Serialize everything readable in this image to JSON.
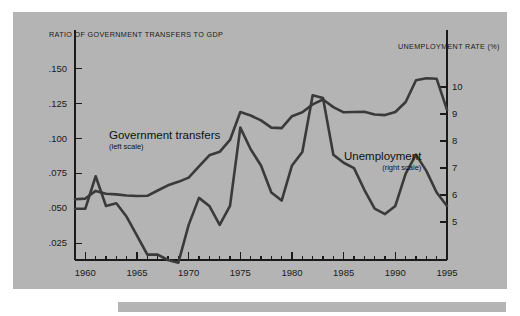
{
  "figure": {
    "panel_color": "#b4b4b4",
    "line_color": "#3a3a3a",
    "axis_color": "#1a1a1a"
  },
  "chart_data": {
    "type": "line",
    "title": "",
    "xlabel": "",
    "ylabel": "RATIO OF GOVERNMENT TRANSFERS TO GDP",
    "y2label": "UNEMPLOYMENT RATE (%)",
    "grid": false,
    "legend_position": "inline-annotation",
    "xlim": [
      1959,
      1995
    ],
    "ylim": [
      0.013,
      0.162
    ],
    "y2lim": [
      3.6,
      11.3
    ],
    "xticks": [
      1960,
      1965,
      1970,
      1975,
      1980,
      1985,
      1990,
      1995
    ],
    "xticklabels": [
      "1960",
      "1965",
      "1970",
      "1975",
      "1980",
      "1985",
      "1990",
      "1995"
    ],
    "xminorticks_every": 1,
    "yticks": [
      0.025,
      0.05,
      0.075,
      0.1,
      0.125,
      0.15
    ],
    "yticklabels": [
      ".025",
      ".050",
      ".075",
      ".100",
      ".125",
      ".150"
    ],
    "y2ticks": [
      5,
      6,
      7,
      8,
      9,
      10
    ],
    "y2ticklabels": [
      "5",
      "6",
      "7",
      "8",
      "9",
      "10"
    ],
    "x": [
      1959,
      1960,
      1961,
      1962,
      1963,
      1964,
      1965,
      1966,
      1967,
      1968,
      1969,
      1970,
      1971,
      1972,
      1973,
      1974,
      1975,
      1976,
      1977,
      1978,
      1979,
      1980,
      1981,
      1982,
      1983,
      1984,
      1985,
      1986,
      1987,
      1988,
      1989,
      1990,
      1991,
      1992,
      1993,
      1994,
      1995
    ],
    "series": [
      {
        "name": "Government transfers",
        "scale": "left",
        "axis": "y",
        "label_note": "(left scale)",
        "values": [
          0.0565,
          0.057,
          0.0625,
          0.0605,
          0.06,
          0.0592,
          0.0588,
          0.059,
          0.0628,
          0.0665,
          0.069,
          0.072,
          0.08,
          0.088,
          0.0905,
          0.099,
          0.119,
          0.1165,
          0.113,
          0.1078,
          0.1075,
          0.116,
          0.1188,
          0.1245,
          0.128,
          0.1225,
          0.1188,
          0.119,
          0.1192,
          0.1172,
          0.1168,
          0.119,
          0.1262,
          0.1418,
          0.1432,
          0.1428,
          0.1205
        ]
      },
      {
        "name": "Unemployment",
        "scale": "right",
        "axis": "y2",
        "label_note": "(right scale)",
        "values": [
          5.5,
          5.5,
          6.7,
          5.6,
          5.7,
          5.2,
          4.5,
          3.8,
          3.8,
          3.6,
          3.5,
          4.9,
          5.9,
          5.6,
          4.9,
          5.6,
          8.5,
          7.7,
          7.1,
          6.1,
          5.8,
          7.1,
          7.6,
          9.7,
          9.6,
          7.5,
          7.2,
          7.0,
          6.2,
          5.5,
          5.3,
          5.6,
          6.8,
          7.5,
          6.9,
          6.1,
          5.6
        ]
      }
    ]
  },
  "annotations": {
    "transfers": {
      "name": "Government transfers",
      "scale_note": "(left scale)"
    },
    "unemployment": {
      "name": "Unemployment",
      "scale_note": "(right scale)"
    }
  }
}
